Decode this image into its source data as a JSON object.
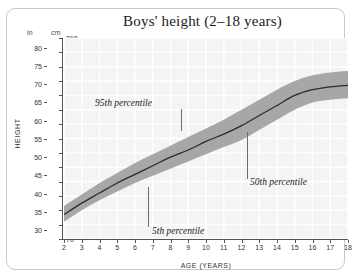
{
  "frame": {
    "present": true
  },
  "axis_units": {
    "inches_header": "in",
    "cm_header": "cm"
  },
  "labels": {
    "y_axis": "HEIGHT",
    "x_axis": "AGE (YEARS)"
  },
  "annotations": [
    {
      "id": "p95",
      "text": "95th percentile"
    },
    {
      "id": "p5",
      "text": "5th percentile"
    },
    {
      "id": "p50",
      "text": "50th percentile"
    }
  ],
  "colors": {
    "band": "#a0a0a0",
    "median_line": "#2b2b2b",
    "plot_background": "#f4f4f4",
    "gridline": "#ffffff",
    "frame_border": "#c9c9c9",
    "text": "#1b1b1b"
  },
  "chart_data": {
    "type": "area",
    "title": "Boys' height (2–18 years)",
    "xlabel": "AGE (YEARS)",
    "ylabel": "HEIGHT",
    "grid": true,
    "legend_position": "none",
    "x": [
      2,
      3,
      4,
      5,
      6,
      7,
      8,
      9,
      10,
      11,
      12,
      13,
      14,
      15,
      16,
      17,
      18
    ],
    "xlim": [
      2,
      18
    ],
    "xticks": [
      2,
      3,
      4,
      5,
      6,
      7,
      8,
      9,
      10,
      11,
      12,
      13,
      14,
      15,
      16,
      17,
      18
    ],
    "y_axis_cm": {
      "unit": "cm",
      "lim": [
        70,
        210
      ],
      "ticks": [
        70,
        80,
        90,
        100,
        110,
        120,
        130,
        140,
        150,
        160,
        170,
        180,
        190,
        200,
        210
      ]
    },
    "y_axis_in": {
      "unit": "in",
      "ticks": [
        30,
        35,
        40,
        45,
        50,
        55,
        60,
        65,
        70,
        75,
        80
      ]
    },
    "series": [
      {
        "name": "5th percentile",
        "unit": "cm",
        "values": [
          82,
          90,
          97,
          103,
          109,
          114,
          119,
          124,
          129,
          134,
          139,
          146,
          153,
          160,
          165,
          167,
          168
        ]
      },
      {
        "name": "50th percentile",
        "unit": "cm",
        "values": [
          87,
          95,
          102,
          109,
          115,
          121,
          127,
          132,
          138,
          143,
          149,
          156,
          163,
          170,
          174,
          176,
          177
        ]
      },
      {
        "name": "95th percentile",
        "unit": "cm",
        "values": [
          93,
          101,
          109,
          116,
          123,
          129,
          135,
          141,
          147,
          153,
          160,
          167,
          174,
          180,
          184,
          186,
          187
        ]
      }
    ]
  }
}
